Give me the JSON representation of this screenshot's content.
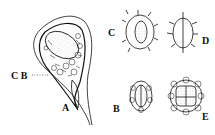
{
  "figure": {
    "panels": [
      {
        "id": "A",
        "label": "A",
        "description": "Large teardrop-shaped seed with stippled embryo and reticulate cellular coat"
      },
      {
        "id": "B",
        "label": "B",
        "description": "Small oval seed with reticulate coat and stippled interior"
      },
      {
        "id": "C",
        "label": "C",
        "description": "Oval seed with spiny reticulate coat and stippled center"
      },
      {
        "id": "D",
        "label": "D",
        "description": "Oval outline with radiating spines and central line"
      },
      {
        "id": "E",
        "label": "E",
        "description": "Rounded seed with polygonal reticulate coat, stippled quadrants"
      }
    ],
    "callout": {
      "labels": "C B",
      "pointer": "dotted leader line to A"
    },
    "colors": {
      "ink": "#111111",
      "background": "#ffffff"
    }
  }
}
